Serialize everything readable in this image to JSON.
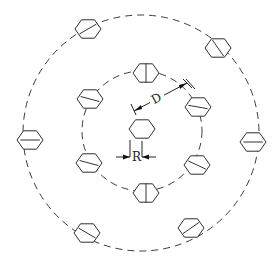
{
  "diagram": {
    "title": "",
    "labels": {
      "spacing": "D",
      "radius": "R"
    },
    "center_element": {
      "x": 142,
      "y": 129,
      "r": 13
    },
    "inner_ring": {
      "cx": 142,
      "cy": 131,
      "r": 60,
      "elements": [
        {
          "x": 146,
          "y": 73,
          "rot": 90
        },
        {
          "x": 198,
          "y": 107,
          "rot": 10
        },
        {
          "x": 197,
          "y": 165,
          "rot": 25
        },
        {
          "x": 146,
          "y": 193,
          "rot": 90
        },
        {
          "x": 89,
          "y": 163,
          "rot": 15
        },
        {
          "x": 90,
          "y": 99,
          "rot": 15
        }
      ]
    },
    "outer_ring": {
      "cx": 141,
      "cy": 133,
      "r": 118,
      "elements": [
        {
          "x": 88,
          "y": 29,
          "rot": -30
        },
        {
          "x": 218,
          "y": 48,
          "rot": 55
        },
        {
          "x": 253,
          "y": 142,
          "rot": 0
        },
        {
          "x": 191,
          "y": 228,
          "rot": -35
        },
        {
          "x": 87,
          "y": 233,
          "rot": 30
        },
        {
          "x": 30,
          "y": 140,
          "rot": 0
        }
      ]
    }
  }
}
